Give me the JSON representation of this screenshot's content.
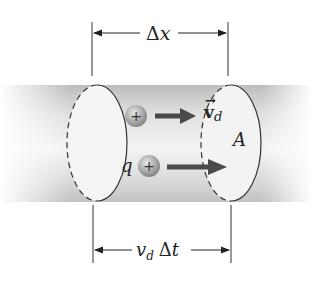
{
  "figure": {
    "top_dimension": {
      "symbol": "Δ",
      "variable": "x"
    },
    "bottom_dimension": {
      "v": "v",
      "sub": "d",
      "delta": "Δ",
      "t": "t"
    },
    "velocity_label": {
      "symbol": "v",
      "sub": "d",
      "arrow": "→"
    },
    "area_label": "A",
    "charge_label": "q",
    "charge_sign": "+",
    "colors": {
      "cylinder_light": "#f6f6f6",
      "cylinder_dark": "#c9c9c9",
      "arrow": "#444444",
      "charge": "#9a9a9a",
      "outline": "#333333"
    }
  }
}
